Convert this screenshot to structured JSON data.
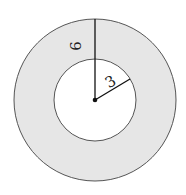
{
  "diagram": {
    "type": "annulus",
    "outer_radius_label": "6",
    "inner_radius_label": "3",
    "colors": {
      "ring_fill": "#e6e6e6",
      "inner_fill": "#ffffff",
      "stroke": "#555555",
      "line": "#111111"
    }
  }
}
